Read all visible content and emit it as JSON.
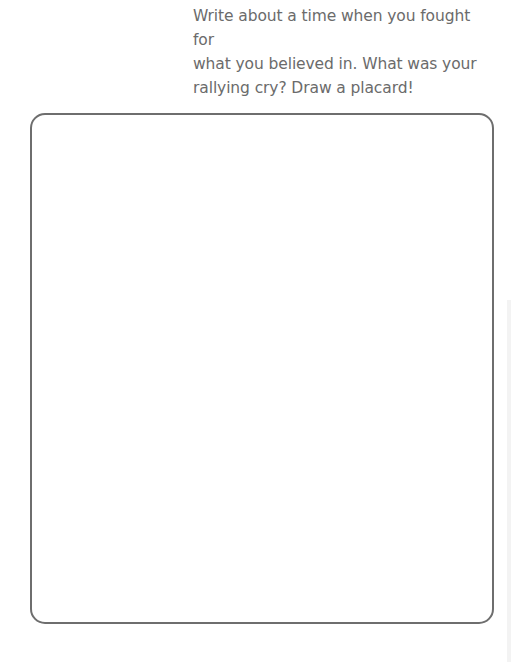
{
  "page": {
    "prompt": {
      "lines": [
        "Write about a time when you fought for",
        "what you believed in. What was your",
        "rallying cry? Draw a placard!"
      ]
    },
    "placard": {
      "content": ""
    }
  },
  "colors": {
    "text": "#6b6b6b",
    "border": "#6e6e6e",
    "background": "#ffffff"
  }
}
